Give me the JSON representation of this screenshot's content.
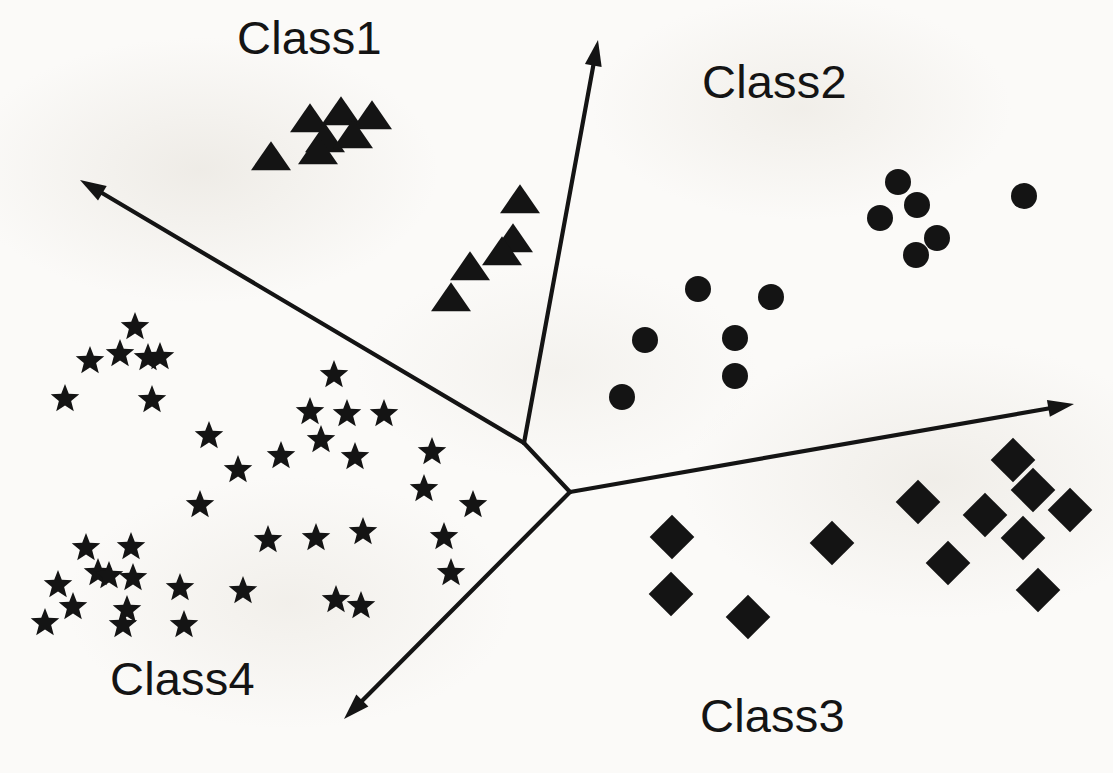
{
  "figure": {
    "background_color": "#fbfaf8",
    "ink_color": "#141414",
    "width": 1113,
    "height": 773
  },
  "labels": [
    {
      "id": "class1",
      "text": "Class1",
      "x": 237,
      "y": 14,
      "font_size": 47
    },
    {
      "id": "class2",
      "text": "Class2",
      "x": 702,
      "y": 58,
      "font_size": 47
    },
    {
      "id": "class3",
      "text": "Class3",
      "x": 700,
      "y": 692,
      "font_size": 47
    },
    {
      "id": "class4",
      "text": "Class4",
      "x": 110,
      "y": 655,
      "font_size": 47
    }
  ],
  "axes": {
    "description": "Y-shaped radial axis system with two junction nodes and four outward arrows",
    "stroke_width": 4.2,
    "junction_upper": {
      "x": 524,
      "y": 443
    },
    "junction_lower": {
      "x": 570,
      "y": 492
    },
    "arrows": [
      {
        "id": "axis-up",
        "label": "Class1 / Class2 separator",
        "from_node": "junction_upper",
        "tip_x": 598,
        "tip_y": 40
      },
      {
        "id": "axis-upper-left",
        "label": "Class1 / Class4 separator",
        "from_node": "junction_upper",
        "tip_x": 80,
        "tip_y": 180
      },
      {
        "id": "axis-right",
        "label": "Class2 / Class3 separator",
        "from_node": "junction_lower",
        "tip_x": 1074,
        "tip_y": 404
      },
      {
        "id": "axis-lower-left",
        "label": "Class3 / Class4 separator",
        "from_node": "junction_lower",
        "tip_x": 344,
        "tip_y": 719
      }
    ]
  },
  "chart_data": {
    "type": "scatter",
    "xlabel": "",
    "ylabel": "",
    "xlim": [
      0,
      1113
    ],
    "ylim": [
      0,
      773
    ],
    "grid": false,
    "legend": "inline class labels",
    "note": "Point coordinates are in image pixel space; y increases downward.",
    "series": [
      {
        "name": "Class1",
        "marker": "triangle",
        "color": "#141414",
        "marker_size": 40,
        "count": 10,
        "points": [
          [
            310,
            120
          ],
          [
            341,
            113
          ],
          [
            372,
            117
          ],
          [
            325,
            140
          ],
          [
            353,
            136
          ],
          [
            318,
            152
          ],
          [
            271,
            158
          ],
          [
            520,
            201
          ],
          [
            513,
            240
          ],
          [
            502,
            253
          ],
          [
            470,
            268
          ],
          [
            451,
            299
          ]
        ]
      },
      {
        "name": "Class2",
        "marker": "circle",
        "color": "#141414",
        "marker_size": 26,
        "count": 12,
        "points": [
          [
            898,
            182
          ],
          [
            1024,
            196
          ],
          [
            917,
            205
          ],
          [
            880,
            218
          ],
          [
            937,
            238
          ],
          [
            916,
            255
          ],
          [
            698,
            289
          ],
          [
            771,
            297
          ],
          [
            645,
            340
          ],
          [
            735,
            338
          ],
          [
            735,
            376
          ],
          [
            622,
            397
          ]
        ]
      },
      {
        "name": "Class3",
        "marker": "diamond",
        "color": "#141414",
        "marker_size": 36,
        "count": 12,
        "points": [
          [
            1013,
            460
          ],
          [
            1033,
            490
          ],
          [
            918,
            502
          ],
          [
            1070,
            510
          ],
          [
            985,
            515
          ],
          [
            1023,
            538
          ],
          [
            832,
            543
          ],
          [
            672,
            537
          ],
          [
            948,
            563
          ],
          [
            1038,
            590
          ],
          [
            671,
            594
          ],
          [
            748,
            617
          ]
        ]
      },
      {
        "name": "Class4",
        "marker": "star",
        "color": "#141414",
        "marker_size": 30,
        "count": 40,
        "points": [
          [
            135,
            327
          ],
          [
            90,
            361
          ],
          [
            120,
            354
          ],
          [
            148,
            358
          ],
          [
            160,
            357
          ],
          [
            65,
            399
          ],
          [
            152,
            400
          ],
          [
            334,
            375
          ],
          [
            310,
            412
          ],
          [
            347,
            414
          ],
          [
            384,
            414
          ],
          [
            321,
            440
          ],
          [
            281,
            456
          ],
          [
            355,
            457
          ],
          [
            432,
            452
          ],
          [
            209,
            436
          ],
          [
            238,
            470
          ],
          [
            424,
            489
          ],
          [
            473,
            505
          ],
          [
            200,
            505
          ],
          [
            268,
            540
          ],
          [
            316,
            538
          ],
          [
            363,
            532
          ],
          [
            86,
            548
          ],
          [
            131,
            547
          ],
          [
            444,
            537
          ],
          [
            98,
            573
          ],
          [
            109,
            576
          ],
          [
            133,
            578
          ],
          [
            58,
            585
          ],
          [
            243,
            591
          ],
          [
            73,
            607
          ],
          [
            127,
            610
          ],
          [
            180,
            588
          ],
          [
            45,
            623
          ],
          [
            123,
            625
          ],
          [
            184,
            625
          ],
          [
            336,
            600
          ],
          [
            361,
            606
          ],
          [
            451,
            573
          ]
        ]
      }
    ]
  }
}
